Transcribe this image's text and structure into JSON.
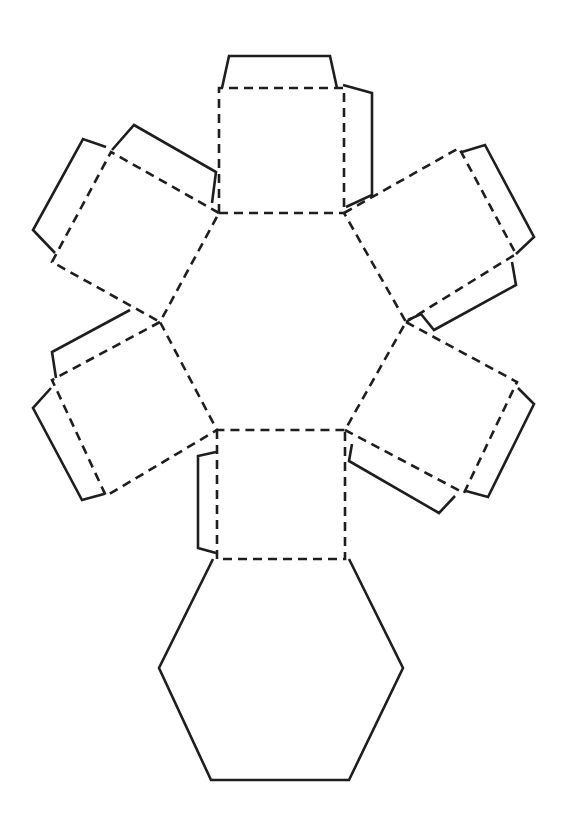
{
  "diagram": {
    "legend": {
      "solid_line": "cut",
      "dashed_line": "fold"
    },
    "colors": {
      "line": "#1e1e1e",
      "background": "#ffffff"
    },
    "faces": {
      "hexagons": 2,
      "squares": 6,
      "tabs": 8
    }
  }
}
